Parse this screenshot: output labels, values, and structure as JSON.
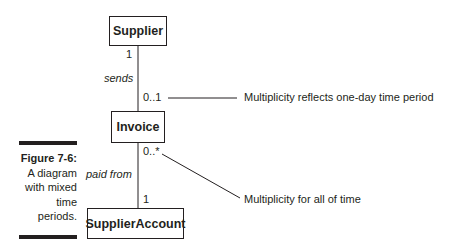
{
  "figure": {
    "number_label": "Figure 7-6:",
    "caption_lines": [
      "A diagram",
      "with mixed",
      "time",
      "periods."
    ]
  },
  "classes": {
    "supplier": "Supplier",
    "invoice": "Invoice",
    "supplier_account": "SupplierAccount"
  },
  "associations": {
    "sends": {
      "name": "sends",
      "supplier_end_multiplicity": "1",
      "invoice_end_multiplicity": "0..1"
    },
    "paid_from": {
      "name": "paid from",
      "invoice_end_multiplicity": "0..*",
      "account_end_multiplicity": "1"
    }
  },
  "annotations": {
    "one_day": "Multiplicity reflects one-day time period",
    "all_time": "Multiplicity for all of time"
  }
}
